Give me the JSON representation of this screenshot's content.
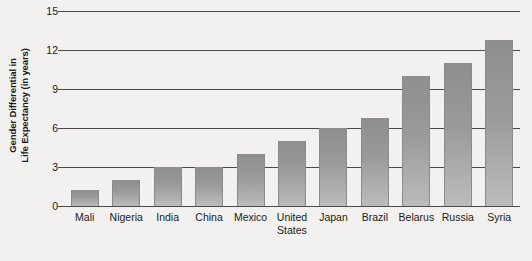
{
  "chart_data": {
    "type": "bar",
    "title": "",
    "xlabel": "",
    "ylabel": "Gender Differential in Life Expectancy (in years)",
    "ylabel_line1": "Gender Differential in",
    "ylabel_line2": "Life Expectancy (in years)",
    "categories": [
      "Mali",
      "Nigeria",
      "India",
      "China",
      "Mexico",
      "United States",
      "Japan",
      "Brazil",
      "Belarus",
      "Russia",
      "Syria"
    ],
    "values": [
      1.2,
      2.0,
      3.0,
      3.0,
      4.0,
      5.0,
      6.0,
      6.8,
      10.0,
      11.0,
      12.8
    ],
    "ylim": [
      0,
      15
    ],
    "yticks": [
      0,
      3,
      6,
      9,
      12,
      15
    ],
    "ytick_labels": [
      "0",
      "3",
      "6",
      "9",
      "12",
      "15"
    ],
    "grid": true,
    "grid_axis": "y",
    "legend": false,
    "bar_color": "#9a9a9a",
    "background_color": "#f2f1ef",
    "axis_color": "#4a4a4a"
  }
}
